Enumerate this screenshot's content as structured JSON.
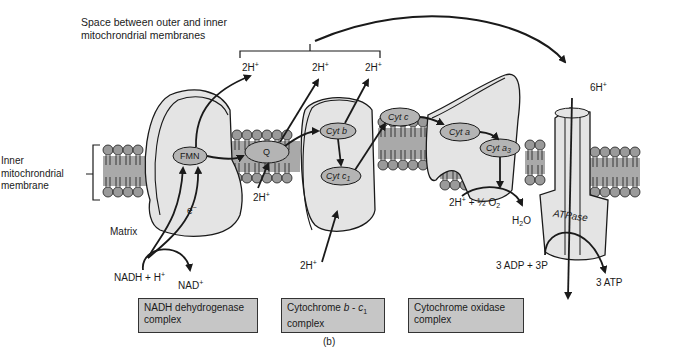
{
  "figure_label": "(b)",
  "intermembrane_space_label_line1": "Space between outer and inner",
  "intermembrane_space_label_line2": "mitochrondrial membranes",
  "inner_membrane_label": [
    "Inner",
    "mitochrondrial",
    "membrane"
  ],
  "matrix_label": "Matrix",
  "carriers": {
    "fmn": "FMN",
    "q": "Q",
    "cyt_b": "Cyt b",
    "cyt_c1_base": "Cyt c",
    "cyt_c1_sub": "1",
    "cyt_c": "Cyt c",
    "cyt_a": "Cyt a",
    "cyt_a3_base": "Cyt a",
    "cyt_a3_sub": "3",
    "atpase": "ATPase"
  },
  "protons": {
    "pump1": "2H",
    "pump2": "2H",
    "pump3": "2H",
    "q_matrix": "2H",
    "cytb_matrix": "2H",
    "atp_intake": "6H",
    "plus": "+"
  },
  "electron": "e",
  "electron_sign": "−",
  "reactions": {
    "nadh": "NADH + H",
    "nad": "NAD",
    "oxygen_left": "2H",
    "oxygen_right": " + ½ O",
    "oxygen_sub": "2",
    "water_h": "H",
    "water_sub": "2",
    "water_o": "O",
    "adp": "3 ADP + 3P",
    "atp": "3 ATP"
  },
  "complexes": [
    {
      "line1": "NADH dehydrogenase",
      "line2": "complex"
    },
    {
      "line1_prefix": "Cytochrome ",
      "line1_b": "b",
      "line1_mid": " - ",
      "line1_c": "c",
      "line1_sub": "1",
      "line2": "complex"
    },
    {
      "line1": "Cytochrome oxidase",
      "line2": "complex"
    }
  ],
  "colors": {
    "membrane_fill": "#a9a9a9",
    "head_fill": "#9a9a9a",
    "protein_fill": "#e4e4e4",
    "carrier_fill": "#b4b4b4",
    "label_box_fill": "#c6c6c6",
    "ink": "#1a1a1a"
  }
}
